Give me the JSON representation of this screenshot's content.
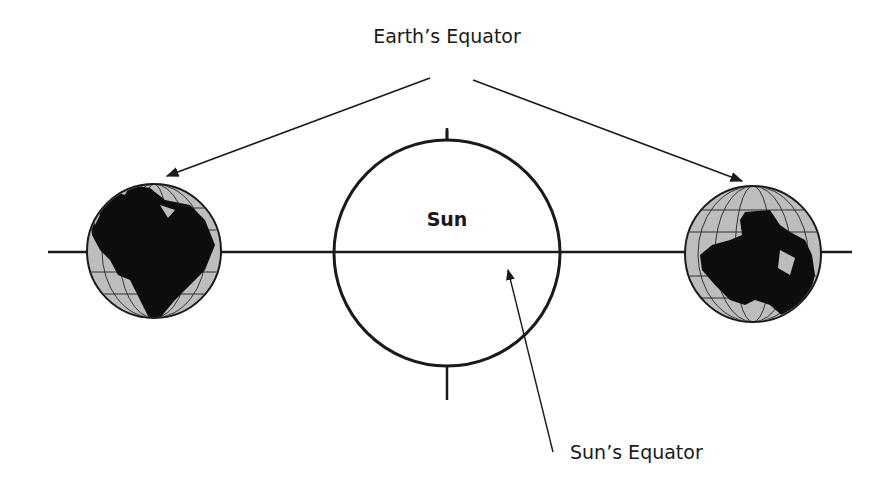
{
  "diagram": {
    "labels": {
      "earth_equator": "Earth’s Equator",
      "sun": "Sun",
      "sun_equator": "Sun’s Equator"
    },
    "elements": {
      "sun": {
        "cx": 447,
        "cy": 253,
        "r": 113,
        "fill": "#ffffff",
        "stroke": "#1a1a1a"
      },
      "left_earth": {
        "cx": 154,
        "cy": 251,
        "r": 67,
        "ocean": "#bdbdbd",
        "land": "#0d0d0d"
      },
      "right_earth": {
        "cx": 753,
        "cy": 254,
        "r": 68,
        "ocean": "#bdbdbd",
        "land": "#0d0d0d"
      },
      "ecliptic_line": {
        "x1": 48,
        "x2": 852,
        "y": 252
      }
    },
    "colors": {
      "line": "#1a1a1a",
      "background": "#ffffff"
    }
  }
}
